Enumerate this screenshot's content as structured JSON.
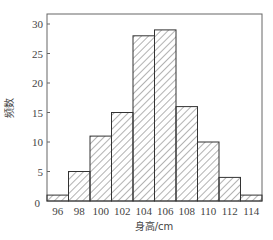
{
  "chart_data": {
    "type": "bar",
    "subtype": "histogram",
    "title": "",
    "xlabel": "身高/cm",
    "ylabel": "频数",
    "bin_edges": [
      95,
      97,
      99,
      101,
      103,
      105,
      107,
      109,
      111,
      113,
      115
    ],
    "categories": [
      "96",
      "98",
      "100",
      "102",
      "104",
      "106",
      "108",
      "110",
      "112",
      "114"
    ],
    "values": [
      1,
      5,
      11,
      15,
      28,
      29,
      16,
      10,
      4,
      1
    ],
    "x_tick_labels": [
      "96",
      "98",
      "100",
      "102",
      "104",
      "106",
      "108",
      "110",
      "112",
      "114"
    ],
    "y_ticks": [
      0,
      5,
      10,
      15,
      20,
      25,
      30
    ],
    "ylim": [
      0,
      32
    ],
    "grid": false,
    "legend": null,
    "bar_fill": "diagonal hatch",
    "colors": {
      "stroke": "#333333",
      "hatch": "#555555",
      "axis": "#555555",
      "background": "#ffffff"
    }
  }
}
